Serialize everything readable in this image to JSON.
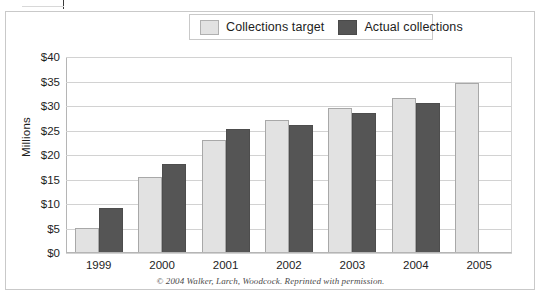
{
  "chart_data": {
    "type": "bar",
    "title": "",
    "xlabel": "",
    "ylabel": "Millions",
    "ylim": [
      0,
      40
    ],
    "ytick_labels": [
      "$40",
      "$35",
      "$30",
      "$25",
      "$20",
      "$15",
      "$10",
      "$5",
      "$0"
    ],
    "ytick_values": [
      40,
      35,
      30,
      25,
      20,
      15,
      10,
      5,
      0
    ],
    "grid": true,
    "legend_position": "top-center",
    "categories": [
      "1999",
      "2000",
      "2001",
      "2002",
      "2003",
      "2004",
      "2005"
    ],
    "series": [
      {
        "name": "Collections target",
        "color": "#e2e2e2",
        "values": [
          5,
          15.3,
          23,
          27,
          29.5,
          31.5,
          34.7
        ]
      },
      {
        "name": "Actual collections",
        "color": "#555555",
        "values": [
          9,
          18,
          25.2,
          26,
          28.5,
          30.5,
          null
        ]
      }
    ],
    "annotations": [
      "© 2004 Walker, Larch, Woodcock. Reprinted with permission."
    ]
  },
  "legend": {
    "items": [
      {
        "label": "Collections target"
      },
      {
        "label": "Actual collections"
      }
    ]
  },
  "axis": {
    "y_title": "Millions"
  },
  "credit": {
    "text": "© 2004 Walker, Larch, Woodcock. Reprinted with permission."
  },
  "colors": {
    "target_fill": "#e2e2e2",
    "actual_fill": "#555555",
    "gridline": "#d2d2d2",
    "axis": "#b5b5b5",
    "frame": "#c9c9c9",
    "text": "#1d1d1d"
  }
}
